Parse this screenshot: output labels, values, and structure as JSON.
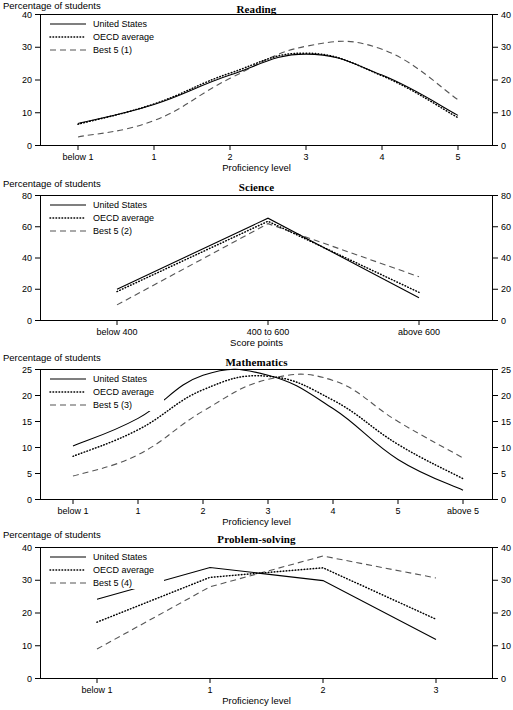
{
  "figure": {
    "width": 513,
    "height": 710,
    "series_names": [
      "United States",
      "OECD average",
      "Best 5"
    ],
    "y_axis_note": "Percentage of students"
  },
  "panels": [
    {
      "id": "reading",
      "title": "Reading",
      "y_note": "Percentage of students",
      "x_label": "Proficiency level",
      "legend": [
        "United States",
        "OECD average",
        "Best 5 (1)"
      ],
      "chart_data": {
        "type": "line",
        "title": "Reading",
        "xlabel": "Proficiency level",
        "ylabel": "Percentage of students",
        "categories": [
          "below 1",
          "1",
          "2",
          "3",
          "4",
          "5"
        ],
        "ylim": [
          0,
          40
        ],
        "yticks": [
          0,
          10,
          20,
          30,
          40
        ],
        "grid": false,
        "legend_position": "top-left",
        "dual_y_axis": true,
        "series": [
          {
            "name": "United States",
            "style": "solid",
            "values": [
              6.7,
              12.5,
              21.5,
              27.9,
              21.5,
              9.2
            ]
          },
          {
            "name": "OECD average",
            "style": "dotted",
            "values": [
              6.5,
              12.7,
              22.1,
              28.2,
              21.3,
              8.5
            ]
          },
          {
            "name": "Best 5 (1)",
            "style": "dashed",
            "values": [
              2.6,
              7.6,
              20.5,
              30.3,
              29.4,
              14.0
            ]
          }
        ]
      }
    },
    {
      "id": "science",
      "title": "Science",
      "y_note": "Percentage of students",
      "x_label": "Score points",
      "legend": [
        "United States",
        "OECD average",
        "Best 5 (2)"
      ],
      "chart_data": {
        "type": "line",
        "title": "Science",
        "xlabel": "Score points",
        "ylabel": "Percentage of students",
        "categories": [
          "below 400",
          "400 to 600",
          "above 600"
        ],
        "ylim": [
          0,
          80
        ],
        "yticks": [
          0,
          20,
          40,
          60,
          80
        ],
        "grid": false,
        "legend_position": "top-left",
        "dual_y_axis": true,
        "series": [
          {
            "name": "United States",
            "style": "solid",
            "values": [
              20.0,
              65.5,
              14.5
            ]
          },
          {
            "name": "OECD average",
            "style": "dotted",
            "values": [
              18.5,
              63.5,
              18.0
            ]
          },
          {
            "name": "Best 5 (2)",
            "style": "dashed",
            "values": [
              10.0,
              62.0,
              28.0
            ]
          }
        ]
      }
    },
    {
      "id": "mathematics",
      "title": "Mathematics",
      "y_note": "Percentage of students",
      "x_label": "Proficiency level",
      "legend": [
        "United States",
        "OECD average",
        "Best 5 (3)"
      ],
      "chart_data": {
        "type": "line",
        "title": "Mathematics",
        "xlabel": "Proficiency level",
        "ylabel": "Percentage of students",
        "categories": [
          "below 1",
          "1",
          "2",
          "3",
          "4",
          "5",
          "above 5"
        ],
        "ylim": [
          0,
          25
        ],
        "yticks": [
          0,
          5,
          10,
          15,
          20,
          25
        ],
        "grid": false,
        "legend_position": "top-left",
        "dual_y_axis": true,
        "series": [
          {
            "name": "United States",
            "style": "solid",
            "values": [
              10.3,
              15.6,
              23.9,
              23.9,
              17.5,
              7.7,
              1.8
            ]
          },
          {
            "name": "OECD average",
            "style": "dotted",
            "values": [
              8.3,
              13.4,
              21.1,
              23.7,
              19.1,
              10.6,
              4.0
            ]
          },
          {
            "name": "Best 5 (3)",
            "style": "dashed",
            "values": [
              4.5,
              8.6,
              17.0,
              23.1,
              22.9,
              15.0,
              8.0
            ]
          }
        ]
      }
    },
    {
      "id": "problem-solving",
      "title": "Problem-solving",
      "y_note": "Percentage of students",
      "x_label": "Proficiency level",
      "legend": [
        "United States",
        "OECD average",
        "Best 5 (4)"
      ],
      "chart_data": {
        "type": "line",
        "title": "Problem-solving",
        "xlabel": "Proficiency level",
        "ylabel": "Percentage of students",
        "categories": [
          "below 1",
          "1",
          "2",
          "3"
        ],
        "ylim": [
          0,
          40
        ],
        "yticks": [
          0,
          10,
          20,
          30,
          40
        ],
        "grid": false,
        "legend_position": "top-left",
        "dual_y_axis": true,
        "series": [
          {
            "name": "United States",
            "style": "solid",
            "values": [
              24.2,
              33.9,
              29.9,
              11.9
            ]
          },
          {
            "name": "OECD average",
            "style": "dotted",
            "values": [
              17.2,
              30.9,
              33.8,
              18.1
            ]
          },
          {
            "name": "Best 5 (4)",
            "style": "dashed",
            "values": [
              9.0,
              28.0,
              37.4,
              30.7
            ]
          }
        ]
      }
    }
  ]
}
